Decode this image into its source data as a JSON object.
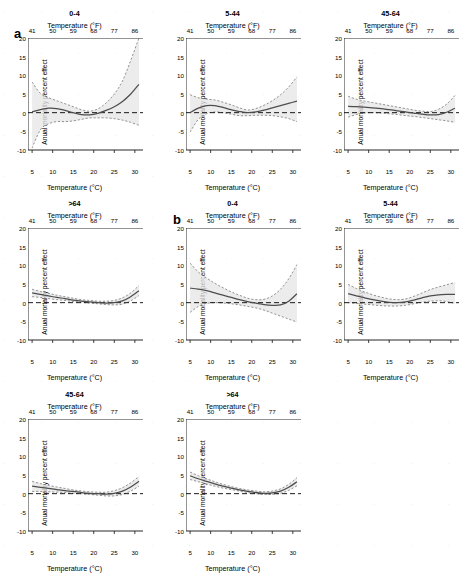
{
  "figure": {
    "panel_letters": [
      {
        "label": "a",
        "x": 14,
        "y": 26
      },
      {
        "label": "b",
        "x": 173,
        "y": 212
      }
    ],
    "axis": {
      "top_title": "Temperature (°F)",
      "bottom_title": "Temperature (°C)",
      "y_title": "Anual mortality percent effect",
      "f_ticks": [
        "41",
        "50",
        "59",
        "68",
        "77",
        "86"
      ],
      "c_ticks": [
        "5",
        "10",
        "15",
        "20",
        "25",
        "30"
      ],
      "y_ticks": [
        "20",
        "15",
        "10",
        "5",
        "0",
        "-5",
        "-10"
      ]
    },
    "colors": {
      "line": "#4d4d4d",
      "ci": "#7a7a7a",
      "band": "#e6e6e6",
      "axis": "#111111",
      "reference": "#000000"
    }
  },
  "chart_data": [
    {
      "type": "line",
      "panel_group": "a",
      "panel_index": 0,
      "title": "0-4",
      "xlabel": "Temperature (°C)",
      "xlabel_secondary": "Temperature (°F)",
      "ylabel": "Anual mortality percent effect",
      "xlim": [
        4,
        31.5
      ],
      "ylim": [
        -10,
        20
      ],
      "xticks": [
        5,
        10,
        15,
        20,
        25,
        30
      ],
      "xticks_f": [
        41,
        50,
        59,
        68,
        77,
        86
      ],
      "yticks": [
        20,
        15,
        10,
        5,
        0,
        -5,
        -10
      ],
      "grid": false,
      "reference_line_y": 0,
      "x": [
        5,
        7,
        9,
        11,
        13,
        15,
        17,
        19,
        21,
        23,
        25,
        27,
        29,
        31
      ],
      "series": [
        {
          "name": "estimate",
          "values": [
            0.2,
            0.8,
            1.2,
            1.1,
            0.6,
            0.0,
            -0.5,
            -0.6,
            -0.2,
            0.6,
            1.6,
            3.0,
            5.0,
            7.6
          ]
        },
        {
          "name": "upper_ci",
          "values": [
            8.2,
            5.2,
            4.0,
            3.2,
            2.4,
            1.6,
            0.8,
            0.4,
            1.0,
            2.6,
            5.0,
            8.5,
            14.0,
            20.0
          ]
        },
        {
          "name": "lower_ci",
          "values": [
            -9.5,
            -4.6,
            -3.0,
            -2.4,
            -2.4,
            -2.2,
            -1.8,
            -1.4,
            -1.4,
            -1.4,
            -1.6,
            -2.0,
            -2.6,
            -3.4
          ]
        }
      ]
    },
    {
      "type": "line",
      "panel_group": "a",
      "panel_index": 1,
      "title": "5-44",
      "xlabel": "Temperature (°C)",
      "xlabel_secondary": "Temperature (°F)",
      "ylabel": "Anual mortality percent effect",
      "xlim": [
        4,
        31.5
      ],
      "ylim": [
        -10,
        20
      ],
      "xticks": [
        5,
        10,
        15,
        20,
        25,
        30
      ],
      "xticks_f": [
        41,
        50,
        59,
        68,
        77,
        86
      ],
      "yticks": [
        20,
        15,
        10,
        5,
        0,
        -5,
        -10
      ],
      "grid": false,
      "reference_line_y": 0,
      "x": [
        5,
        7,
        9,
        11,
        13,
        15,
        17,
        19,
        21,
        23,
        25,
        27,
        29,
        31
      ],
      "series": [
        {
          "name": "estimate",
          "values": [
            0.0,
            1.2,
            1.9,
            1.9,
            1.4,
            0.8,
            0.3,
            0.0,
            0.2,
            0.7,
            1.3,
            1.9,
            2.5,
            3.1
          ]
        },
        {
          "name": "upper_ci",
          "values": [
            4.8,
            4.0,
            3.6,
            3.4,
            2.8,
            2.1,
            1.3,
            0.7,
            1.1,
            2.0,
            3.2,
            4.8,
            6.9,
            9.6
          ]
        },
        {
          "name": "lower_ci",
          "values": [
            -5.2,
            -1.8,
            -0.3,
            0.2,
            0.0,
            -0.4,
            -0.8,
            -0.8,
            -0.7,
            -0.7,
            -0.8,
            -1.1,
            -1.6,
            -2.4
          ]
        }
      ]
    },
    {
      "type": "line",
      "panel_group": "a",
      "panel_index": 2,
      "title": "45-64",
      "xlabel": "Temperature (°C)",
      "xlabel_secondary": "Temperature (°F)",
      "ylabel": "Anual mortality percent effect",
      "xlim": [
        4,
        31.5
      ],
      "ylim": [
        -10,
        20
      ],
      "xticks": [
        5,
        10,
        15,
        20,
        25,
        30
      ],
      "xticks_f": [
        41,
        50,
        59,
        68,
        77,
        86
      ],
      "yticks": [
        20,
        15,
        10,
        5,
        0,
        -5,
        -10
      ],
      "grid": false,
      "reference_line_y": 0,
      "x": [
        5,
        7,
        9,
        11,
        13,
        15,
        17,
        19,
        21,
        23,
        25,
        27,
        29,
        31
      ],
      "series": [
        {
          "name": "estimate",
          "values": [
            1.7,
            1.6,
            1.5,
            1.3,
            1.1,
            0.8,
            0.5,
            0.2,
            -0.1,
            -0.4,
            -0.6,
            -0.5,
            0.1,
            1.2
          ]
        },
        {
          "name": "upper_ci",
          "values": [
            4.4,
            3.6,
            3.1,
            2.7,
            2.3,
            1.9,
            1.5,
            1.1,
            0.7,
            0.4,
            0.3,
            0.9,
            2.3,
            4.6
          ]
        },
        {
          "name": "lower_ci",
          "values": [
            -1.2,
            -0.5,
            -0.1,
            0.0,
            -0.1,
            -0.3,
            -0.5,
            -0.8,
            -1.0,
            -1.3,
            -1.6,
            -1.9,
            -2.2,
            -2.6
          ]
        }
      ]
    },
    {
      "type": "line",
      "panel_group": "a",
      "panel_index": 3,
      "title": ">64",
      "xlabel": "Temperature (°C)",
      "xlabel_secondary": "Temperature (°F)",
      "ylabel": "Anual mortality percent effect",
      "xlim": [
        4,
        31.5
      ],
      "ylim": [
        -10,
        20
      ],
      "xticks": [
        5,
        10,
        15,
        20,
        25,
        30
      ],
      "xticks_f": [
        41,
        50,
        59,
        68,
        77,
        86
      ],
      "yticks": [
        20,
        15,
        10,
        5,
        0,
        -5,
        -10
      ],
      "grid": false,
      "reference_line_y": 0,
      "x": [
        5,
        7,
        9,
        11,
        13,
        15,
        17,
        19,
        21,
        23,
        25,
        27,
        29,
        31
      ],
      "series": [
        {
          "name": "estimate",
          "values": [
            2.6,
            2.2,
            1.8,
            1.4,
            1.1,
            0.7,
            0.4,
            0.2,
            0.0,
            -0.1,
            0.0,
            0.5,
            1.6,
            3.2
          ]
        },
        {
          "name": "upper_ci",
          "values": [
            3.6,
            3.0,
            2.5,
            2.0,
            1.6,
            1.2,
            0.8,
            0.6,
            0.4,
            0.4,
            0.6,
            1.3,
            2.6,
            4.6
          ]
        },
        {
          "name": "lower_ci",
          "values": [
            1.6,
            1.4,
            1.1,
            0.8,
            0.6,
            0.3,
            0.1,
            -0.1,
            -0.3,
            -0.5,
            -0.6,
            -0.4,
            0.5,
            1.9
          ]
        }
      ]
    },
    {
      "type": "line",
      "panel_group": "b",
      "panel_index": 0,
      "title": "0-4",
      "xlabel": "Temperature (°C)",
      "xlabel_secondary": "Temperature (°F)",
      "ylabel": "Anual mortality percent effect",
      "xlim": [
        4,
        31.5
      ],
      "ylim": [
        -10,
        20
      ],
      "xticks": [
        5,
        10,
        15,
        20,
        25,
        30
      ],
      "xticks_f": [
        41,
        50,
        59,
        68,
        77,
        86
      ],
      "yticks": [
        20,
        15,
        10,
        5,
        0,
        -5,
        -10
      ],
      "grid": false,
      "reference_line_y": 0,
      "x": [
        5,
        7,
        9,
        11,
        13,
        15,
        17,
        19,
        21,
        23,
        25,
        27,
        29,
        31
      ],
      "series": [
        {
          "name": "estimate",
          "values": [
            3.9,
            3.6,
            3.2,
            2.6,
            2.0,
            1.4,
            0.8,
            0.3,
            -0.1,
            -0.5,
            -0.7,
            -0.6,
            0.4,
            2.4
          ]
        },
        {
          "name": "upper_ci",
          "values": [
            10.6,
            8.2,
            6.6,
            5.2,
            4.0,
            2.9,
            2.0,
            1.2,
            0.8,
            0.9,
            1.8,
            3.6,
            6.4,
            10.2
          ]
        },
        {
          "name": "lower_ci",
          "values": [
            -2.6,
            -1.0,
            -0.2,
            0.0,
            -0.1,
            -0.3,
            -0.6,
            -1.0,
            -1.4,
            -2.0,
            -2.8,
            -3.6,
            -4.4,
            -5.2
          ]
        }
      ]
    },
    {
      "type": "line",
      "panel_group": "b",
      "panel_index": 1,
      "title": "5-44",
      "xlabel": "Temperature (°C)",
      "xlabel_secondary": "Temperature (°F)",
      "ylabel": "Anual mortality percent effect",
      "xlim": [
        4,
        31.5
      ],
      "ylim": [
        -10,
        20
      ],
      "xticks": [
        5,
        10,
        15,
        20,
        25,
        30
      ],
      "xticks_f": [
        41,
        50,
        59,
        68,
        77,
        86
      ],
      "yticks": [
        20,
        15,
        10,
        5,
        0,
        -5,
        -10
      ],
      "grid": false,
      "reference_line_y": 0,
      "x": [
        5,
        7,
        9,
        11,
        13,
        15,
        17,
        19,
        21,
        23,
        25,
        27,
        29,
        31
      ],
      "series": [
        {
          "name": "estimate",
          "values": [
            2.4,
            1.8,
            1.3,
            0.8,
            0.4,
            0.1,
            0.0,
            0.2,
            0.7,
            1.3,
            1.8,
            2.1,
            2.2,
            2.2
          ]
        },
        {
          "name": "upper_ci",
          "values": [
            4.9,
            3.8,
            2.9,
            2.1,
            1.5,
            1.0,
            0.8,
            1.0,
            1.7,
            2.6,
            3.5,
            4.2,
            4.8,
            5.4
          ]
        },
        {
          "name": "lower_ci",
          "values": [
            0.0,
            -0.2,
            -0.4,
            -0.6,
            -0.8,
            -0.9,
            -0.9,
            -0.7,
            -0.3,
            0.1,
            0.4,
            0.5,
            0.3,
            -0.2
          ]
        }
      ]
    },
    {
      "type": "line",
      "panel_group": "b",
      "panel_index": 2,
      "title": "45-64",
      "xlabel": "Temperature (°C)",
      "xlabel_secondary": "Temperature (°F)",
      "ylabel": "Anual mortality percent effect",
      "xlim": [
        4,
        31.5
      ],
      "ylim": [
        -10,
        20
      ],
      "xticks": [
        5,
        10,
        15,
        20,
        25,
        30
      ],
      "xticks_f": [
        41,
        50,
        59,
        68,
        77,
        86
      ],
      "yticks": [
        20,
        15,
        10,
        5,
        0,
        -5,
        -10
      ],
      "grid": false,
      "reference_line_y": 0,
      "x": [
        5,
        7,
        9,
        11,
        13,
        15,
        17,
        19,
        21,
        23,
        25,
        27,
        29,
        31
      ],
      "series": [
        {
          "name": "estimate",
          "values": [
            2.0,
            1.7,
            1.4,
            1.1,
            0.8,
            0.6,
            0.3,
            0.1,
            0.0,
            -0.1,
            0.1,
            0.7,
            1.8,
            3.3
          ]
        },
        {
          "name": "upper_ci",
          "values": [
            3.3,
            2.7,
            2.2,
            1.8,
            1.4,
            1.0,
            0.7,
            0.5,
            0.4,
            0.4,
            0.8,
            1.6,
            2.9,
            4.6
          ]
        },
        {
          "name": "lower_ci",
          "values": [
            0.6,
            0.6,
            0.5,
            0.4,
            0.3,
            0.1,
            0.0,
            -0.2,
            -0.4,
            -0.6,
            -0.6,
            -0.2,
            0.7,
            2.0
          ]
        }
      ]
    },
    {
      "type": "line",
      "panel_group": "b",
      "panel_index": 3,
      "title": ">64",
      "xlabel": "Temperature (°C)",
      "xlabel_secondary": "Temperature (°F)",
      "ylabel": "Anual mortality percent effect",
      "xlim": [
        4,
        31.5
      ],
      "ylim": [
        -10,
        20
      ],
      "xticks": [
        5,
        10,
        15,
        20,
        25,
        30
      ],
      "xticks_f": [
        41,
        50,
        59,
        68,
        77,
        86
      ],
      "yticks": [
        20,
        15,
        10,
        5,
        0,
        -5,
        -10
      ],
      "grid": false,
      "reference_line_y": 0,
      "x": [
        5,
        7,
        9,
        11,
        13,
        15,
        17,
        19,
        21,
        23,
        25,
        27,
        29,
        31
      ],
      "series": [
        {
          "name": "estimate",
          "values": [
            4.8,
            4.0,
            3.3,
            2.6,
            2.0,
            1.5,
            1.0,
            0.6,
            0.3,
            0.1,
            0.2,
            0.7,
            1.7,
            3.2
          ]
        },
        {
          "name": "upper_ci",
          "values": [
            5.8,
            4.8,
            4.0,
            3.2,
            2.5,
            1.9,
            1.4,
            1.0,
            0.7,
            0.5,
            0.7,
            1.3,
            2.5,
            4.3
          ]
        },
        {
          "name": "lower_ci",
          "values": [
            3.8,
            3.2,
            2.6,
            2.0,
            1.5,
            1.1,
            0.7,
            0.3,
            0.0,
            -0.2,
            -0.2,
            0.1,
            0.9,
            2.1
          ]
        }
      ]
    }
  ],
  "panel_positions": [
    {
      "x": 0,
      "y": 0
    },
    {
      "x": 158,
      "y": 0
    },
    {
      "x": 316,
      "y": 0
    },
    {
      "x": 0,
      "y": 190
    },
    {
      "x": 158,
      "y": 190
    },
    {
      "x": 316,
      "y": 190
    },
    {
      "x": 0,
      "y": 381
    },
    {
      "x": 158,
      "y": 381
    }
  ]
}
